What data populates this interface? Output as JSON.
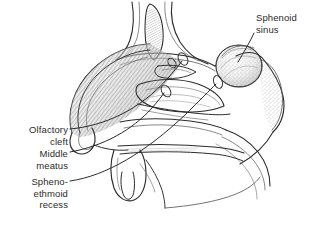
{
  "figure": {
    "background_color": "#ffffff",
    "ink_color": "#2b2b2b",
    "style": "black-and-white pen-and-ink medical line drawing with pencil hatching and stippling"
  },
  "labels": [
    {
      "id": "sphenoid-sinus",
      "text": "Sphenoid\nsinus",
      "align": "left",
      "x": 256,
      "y": 12
    },
    {
      "id": "olfactory-cleft",
      "text": "Olfactory\ncleft",
      "align": "right",
      "x": 6,
      "y": 124
    },
    {
      "id": "middle-meatus",
      "text": "Middle\nmeatus",
      "align": "right",
      "x": 6,
      "y": 148
    },
    {
      "id": "spheno-ethmoid-recess",
      "text": "Spheno-\nethmoid\nrecess",
      "align": "right",
      "x": 6,
      "y": 176
    }
  ],
  "anatomy_regions": [
    "frontal sinus",
    "crista galli",
    "superior turbinate",
    "middle turbinate",
    "inferior turbinate",
    "nasal dorsum",
    "nasal tip",
    "hard palate",
    "soft palate",
    "uvula",
    "sphenoid sinus",
    "clivus",
    "nasopharynx"
  ]
}
